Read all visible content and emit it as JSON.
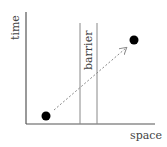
{
  "diagram": {
    "axes": {
      "x_label": "space",
      "y_label": "time"
    },
    "barrier": {
      "label": "barrier"
    },
    "events": [
      {
        "name": "start",
        "x": 46,
        "y": 116
      },
      {
        "name": "end",
        "x": 134,
        "y": 40
      }
    ],
    "colors": {
      "axis": "#555555",
      "barrier": "#888888",
      "dot": "#000000",
      "arrow": "#888888",
      "text": "#444444"
    }
  }
}
